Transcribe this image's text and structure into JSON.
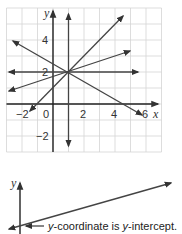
{
  "graph1": {
    "x_label": "x",
    "y_label": "y",
    "x_ticks": [
      {
        "value": -2,
        "label": "−2"
      },
      {
        "value": 0,
        "label": "0"
      },
      {
        "value": 2,
        "label": "2"
      },
      {
        "value": 4,
        "label": "4"
      },
      {
        "value": 6,
        "label": "6"
      }
    ],
    "y_ticks": [
      {
        "value": 4,
        "label": "4"
      },
      {
        "value": 2,
        "label": "2"
      },
      {
        "value": -2,
        "label": "−2"
      }
    ],
    "xlim": [
      -3,
      7
    ],
    "ylim": [
      -3,
      6
    ],
    "intersection_point": [
      1,
      2
    ],
    "lines": [
      {
        "name": "horizontal",
        "equation": "y = 2"
      },
      {
        "name": "vertical",
        "equation": "x = 1"
      },
      {
        "name": "steep-positive",
        "equation": "y = x + 1"
      },
      {
        "name": "shallow-positive",
        "equation": "y = (1/3)x + 5/3"
      },
      {
        "name": "negative",
        "equation": "y = -(1/2)x + 5/2"
      }
    ]
  },
  "graph2": {
    "y_label": "y",
    "annotation_prefix": "y",
    "annotation_mid": "-coordinate is ",
    "annotation_var": "y",
    "annotation_suffix": "-intercept."
  }
}
